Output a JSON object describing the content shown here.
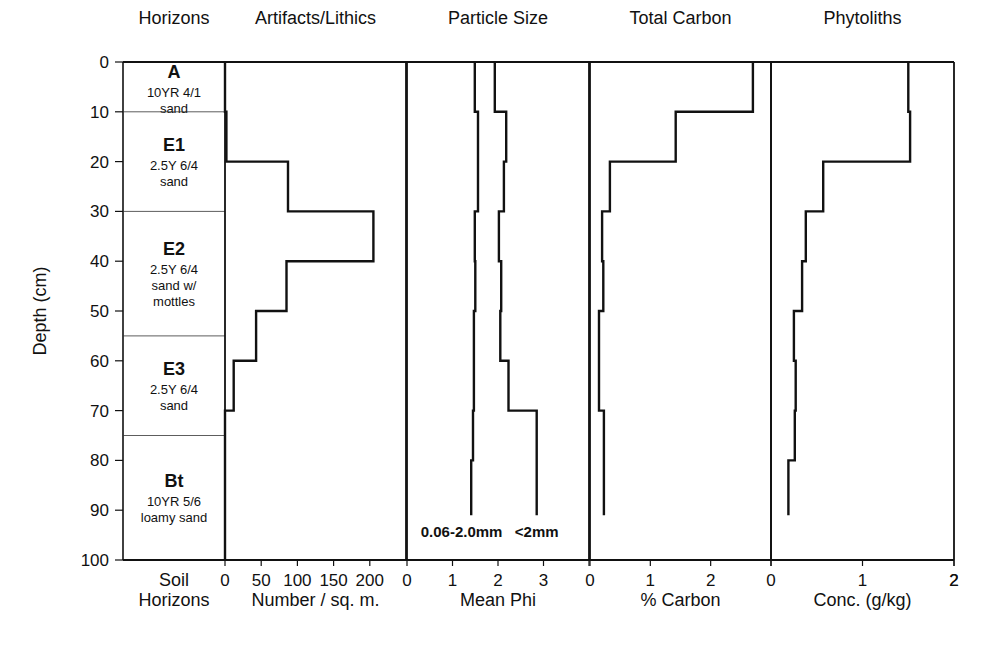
{
  "chart_data": {
    "type": "line",
    "subtype": "stepped depth profile (multi-panel)",
    "y_axis": {
      "label": "Depth (cm)",
      "range": [
        0,
        100
      ],
      "inverted": true,
      "ticks": [
        0,
        10,
        20,
        30,
        40,
        50,
        60,
        70,
        80,
        90,
        100
      ]
    },
    "horizons_panel": {
      "title": "Horizons",
      "xlabel": [
        "Soil",
        "Horizons"
      ],
      "horizons": [
        {
          "name": "A",
          "top": 0,
          "bottom": 10,
          "desc": [
            "10YR 4/1",
            "sand"
          ]
        },
        {
          "name": "E1",
          "top": 10,
          "bottom": 30,
          "desc": [
            "2.5Y 6/4",
            "sand"
          ]
        },
        {
          "name": "E2",
          "top": 30,
          "bottom": 55,
          "desc": [
            "2.5Y 6/4",
            "sand w/",
            "mottles"
          ]
        },
        {
          "name": "E3",
          "top": 55,
          "bottom": 75,
          "desc": [
            "2.5Y 6/4",
            "sand"
          ]
        },
        {
          "name": "Bt",
          "top": 75,
          "bottom": 100,
          "desc": [
            "10YR 5/6",
            "loamy sand"
          ]
        }
      ]
    },
    "panels": [
      {
        "id": "artifacts",
        "title": "Artifacts/Lithics",
        "xlabel": "Number / sq. m.",
        "xlim": [
          0,
          250
        ],
        "ticks": [
          0,
          50,
          100,
          150,
          200
        ],
        "series": [
          {
            "name": "Artifacts/Lithics",
            "intervals": [
              [
                0,
                10
              ],
              [
                10,
                20
              ],
              [
                20,
                30
              ],
              [
                30,
                40
              ],
              [
                40,
                50
              ],
              [
                50,
                60
              ],
              [
                60,
                70
              ],
              [
                70,
                100
              ]
            ],
            "values": [
              0,
              2,
              87,
              205,
              85,
              43,
              12,
              0
            ]
          }
        ]
      },
      {
        "id": "particle",
        "title": "Particle Size",
        "xlabel": "Mean Phi",
        "xlim": [
          0,
          4
        ],
        "ticks": [
          0,
          1,
          2,
          3
        ],
        "series": [
          {
            "name": "0.06-2.0mm",
            "intervals": [
              [
                0,
                10
              ],
              [
                10,
                20
              ],
              [
                20,
                30
              ],
              [
                30,
                40
              ],
              [
                40,
                50
              ],
              [
                50,
                60
              ],
              [
                60,
                70
              ],
              [
                70,
                80
              ],
              [
                80,
                91
              ]
            ],
            "values": [
              1.49,
              1.56,
              1.56,
              1.49,
              1.5,
              1.47,
              1.47,
              1.45,
              1.41
            ]
          },
          {
            "name": "<2mm",
            "intervals": [
              [
                0,
                10
              ],
              [
                10,
                20
              ],
              [
                20,
                30
              ],
              [
                30,
                40
              ],
              [
                40,
                50
              ],
              [
                50,
                60
              ],
              [
                60,
                70
              ],
              [
                70,
                91
              ]
            ],
            "values": [
              1.93,
              2.18,
              2.13,
              2.02,
              2.07,
              2.05,
              2.23,
              2.85
            ]
          }
        ],
        "annotations": [
          {
            "text": "0.06-2.0mm",
            "depth": 95,
            "x": 1.2
          },
          {
            "text": "<2mm",
            "depth": 95,
            "x": 2.85
          }
        ]
      },
      {
        "id": "carbon",
        "title": "Total Carbon",
        "xlabel": "% Carbon",
        "xlim": [
          0,
          3
        ],
        "ticks": [
          0,
          1,
          2
        ],
        "series": [
          {
            "name": "Total Carbon",
            "intervals": [
              [
                0,
                10
              ],
              [
                10,
                20
              ],
              [
                20,
                30
              ],
              [
                30,
                40
              ],
              [
                40,
                50
              ],
              [
                50,
                70
              ],
              [
                70,
                91
              ]
            ],
            "values": [
              2.7,
              1.42,
              0.33,
              0.2,
              0.22,
              0.15,
              0.23
            ]
          }
        ]
      },
      {
        "id": "phytoliths",
        "title": "Phytoliths",
        "xlabel": "Conc. (g/kg)",
        "xlim": [
          0,
          2
        ],
        "ticks": [
          0,
          1,
          2
        ],
        "series": [
          {
            "name": "Phytoliths",
            "intervals": [
              [
                0,
                10
              ],
              [
                10,
                20
              ],
              [
                20,
                30
              ],
              [
                30,
                40
              ],
              [
                40,
                50
              ],
              [
                50,
                60
              ],
              [
                60,
                70
              ],
              [
                70,
                80
              ],
              [
                80,
                91
              ]
            ],
            "values": [
              1.5,
              1.52,
              0.57,
              0.38,
              0.34,
              0.25,
              0.27,
              0.26,
              0.19
            ]
          }
        ]
      }
    ],
    "grid": false,
    "legend": "inline annotations in Particle Size panel"
  },
  "layout": {
    "plot_top": 62,
    "plot_bottom": 560,
    "horizons_x": [
      123,
      225
    ],
    "panel_x": {
      "artifacts": [
        225,
        406
      ],
      "particle": [
        407,
        589
      ],
      "carbon": [
        590,
        771
      ],
      "phytoliths": [
        771,
        954
      ]
    }
  },
  "colors": {
    "line": "#111111",
    "background": "#ffffff",
    "divider": "#333333"
  }
}
